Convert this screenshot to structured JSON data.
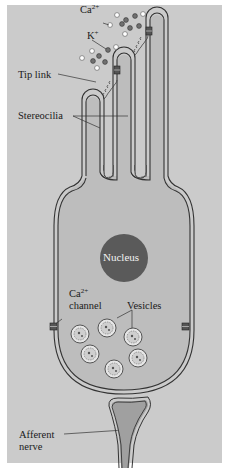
{
  "figure": {
    "labels": {
      "ca_ion": "Ca",
      "ca_ion_charge": "2+",
      "k_ion": "K",
      "k_ion_charge": "+",
      "tip_link": "Tip link",
      "stereocilia": "Stereocilia",
      "nucleus": "Nucleus",
      "ca_channel_line1": "Ca",
      "ca_channel_charge": "2+",
      "ca_channel_line2": "channel",
      "vesicles": "Vesicles",
      "afferent_line1": "Afferent",
      "afferent_line2": "nerve"
    },
    "colors": {
      "background": "#cbcbcb",
      "cell_fill": "#bdbdbd",
      "membrane": "#3a3a3a",
      "nucleus": "#5a5a5a",
      "ca_ion": "#ffffff",
      "k_ion": "#6f6f6f",
      "nerve_fill": "#9e9e9e"
    },
    "counts": {
      "stereocilia": 3,
      "vesicles": 7,
      "tip_links": 2,
      "transduction_channels": 2,
      "ca_channels": 2
    }
  }
}
